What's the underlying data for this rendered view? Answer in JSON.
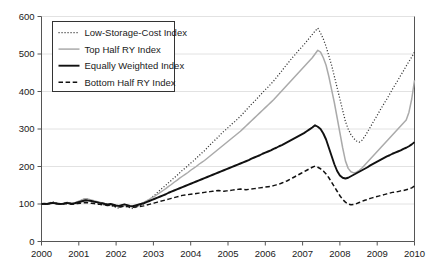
{
  "chart_data": {
    "type": "line",
    "title": "",
    "xlabel": "",
    "ylabel": "",
    "xlim": [
      2000,
      2010
    ],
    "ylim": [
      0,
      600
    ],
    "grid": "horizontal",
    "legend_position": "top-left",
    "yticks": [
      "0",
      "100",
      "200",
      "300",
      "400",
      "500",
      "600"
    ],
    "xticks": [
      "2000",
      "2001",
      "2002",
      "2003",
      "2004",
      "2005",
      "2006",
      "2007",
      "2008",
      "2009",
      "2010"
    ],
    "colors": {
      "low_storage_cost": "#333333",
      "top_half": "#aaaaaa",
      "equally_weighted": "#111111",
      "bottom_half": "#111111",
      "grid": "#e2e2e2",
      "axis": "#555555"
    },
    "series": [
      {
        "name": "Low-Storage-Cost Index",
        "style": "dotted",
        "values": [
          100,
          101,
          99,
          103,
          106,
          104,
          101,
          99,
          102,
          105,
          103,
          100,
          102,
          105,
          108,
          112,
          115,
          113,
          110,
          107,
          104,
          101,
          99,
          97,
          95,
          97,
          94,
          91,
          89,
          92,
          95,
          93,
          90,
          88,
          91,
          94,
          97,
          101,
          106,
          112,
          118,
          124,
          131,
          138,
          144,
          150,
          157,
          163,
          170,
          176,
          183,
          190,
          196,
          202,
          209,
          215,
          222,
          229,
          236,
          242,
          250,
          258,
          265,
          272,
          279,
          287,
          294,
          300,
          307,
          314,
          320,
          327,
          334,
          342,
          350,
          358,
          366,
          373,
          381,
          389,
          397,
          405,
          412,
          420,
          428,
          437,
          446,
          455,
          465,
          474,
          483,
          492,
          500,
          509,
          517,
          525,
          534,
          543,
          552,
          561,
          569,
          556,
          540,
          520,
          495,
          470,
          440,
          410,
          380,
          350,
          320,
          300,
          285,
          275,
          268,
          265,
          270,
          280,
          292,
          305,
          318,
          330,
          343,
          356,
          368,
          380,
          393,
          406,
          418,
          430,
          443,
          455,
          468,
          480,
          492,
          505
        ]
      },
      {
        "name": "Top Half RY Index",
        "style": "solid-thin-gray",
        "values": [
          100,
          101,
          100,
          102,
          104,
          103,
          101,
          100,
          102,
          104,
          103,
          101,
          103,
          106,
          109,
          112,
          114,
          113,
          111,
          109,
          107,
          105,
          103,
          101,
          99,
          101,
          98,
          95,
          93,
          96,
          99,
          97,
          94,
          92,
          95,
          98,
          101,
          104,
          108,
          112,
          117,
          121,
          126,
          131,
          136,
          141,
          147,
          152,
          158,
          163,
          169,
          174,
          179,
          184,
          190,
          195,
          200,
          206,
          211,
          216,
          222,
          228,
          234,
          240,
          246,
          252,
          258,
          264,
          270,
          276,
          282,
          288,
          294,
          301,
          308,
          315,
          322,
          329,
          336,
          343,
          350,
          357,
          364,
          371,
          378,
          386,
          394,
          402,
          410,
          418,
          426,
          434,
          442,
          450,
          458,
          466,
          474,
          482,
          490,
          500,
          510,
          505,
          490,
          470,
          440,
          405,
          370,
          330,
          290,
          250,
          215,
          195,
          186,
          183,
          185,
          190,
          196,
          204,
          212,
          220,
          228,
          236,
          244,
          252,
          260,
          268,
          276,
          284,
          292,
          300,
          308,
          316,
          324,
          345,
          380,
          430
        ]
      },
      {
        "name": "Equally Weighted Index",
        "style": "solid-thick-black",
        "values": [
          100,
          101,
          100,
          102,
          103,
          102,
          101,
          100,
          101,
          103,
          102,
          101,
          102,
          104,
          106,
          108,
          110,
          109,
          108,
          106,
          105,
          103,
          102,
          100,
          99,
          100,
          98,
          96,
          95,
          97,
          99,
          97,
          95,
          94,
          96,
          98,
          100,
          102,
          105,
          108,
          111,
          114,
          117,
          120,
          123,
          126,
          130,
          133,
          136,
          139,
          142,
          145,
          148,
          151,
          154,
          157,
          160,
          163,
          166,
          169,
          172,
          175,
          178,
          181,
          184,
          187,
          190,
          193,
          196,
          199,
          202,
          205,
          208,
          211,
          214,
          217,
          221,
          224,
          227,
          230,
          234,
          237,
          240,
          243,
          247,
          250,
          254,
          257,
          261,
          265,
          269,
          273,
          277,
          281,
          285,
          289,
          294,
          299,
          304,
          310,
          306,
          300,
          288,
          272,
          250,
          228,
          206,
          188,
          176,
          170,
          168,
          170,
          174,
          178,
          182,
          186,
          190,
          194,
          198,
          203,
          207,
          211,
          215,
          219,
          223,
          227,
          230,
          234,
          237,
          240,
          243,
          247,
          250,
          254,
          259,
          265
        ]
      },
      {
        "name": "Bottom Half RY Index",
        "style": "dashed",
        "values": [
          100,
          100,
          99,
          101,
          102,
          101,
          100,
          99,
          100,
          101,
          100,
          99,
          100,
          101,
          102,
          103,
          104,
          103,
          102,
          101,
          100,
          99,
          98,
          97,
          96,
          97,
          95,
          93,
          92,
          93,
          94,
          93,
          92,
          91,
          92,
          93,
          94,
          95,
          97,
          99,
          101,
          103,
          105,
          107,
          109,
          111,
          113,
          115,
          117,
          119,
          121,
          123,
          124,
          125,
          126,
          127,
          128,
          129,
          130,
          131,
          132,
          133,
          134,
          135,
          136,
          135,
          134,
          135,
          136,
          137,
          138,
          139,
          140,
          139,
          138,
          139,
          140,
          141,
          142,
          143,
          144,
          145,
          146,
          147,
          149,
          151,
          153,
          156,
          159,
          162,
          166,
          170,
          174,
          178,
          182,
          186,
          190,
          194,
          198,
          201,
          198,
          194,
          188,
          180,
          170,
          158,
          146,
          134,
          122,
          112,
          105,
          100,
          98,
          99,
          101,
          104,
          107,
          110,
          112,
          115,
          117,
          119,
          121,
          123,
          125,
          127,
          129,
          131,
          132,
          133,
          135,
          136,
          138,
          140,
          143,
          148
        ]
      }
    ]
  },
  "legend": {
    "items": [
      {
        "label": "Low-Storage-Cost Index"
      },
      {
        "label": "Top Half RY Index"
      },
      {
        "label": "Equally Weighted Index"
      },
      {
        "label": "Bottom Half RY Index"
      }
    ]
  }
}
